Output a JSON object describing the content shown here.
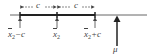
{
  "diagram": {
    "type": "confidence-interval-number-line",
    "dimension_labels": [
      "c",
      "c"
    ],
    "points": [
      {
        "var": "x",
        "sub": "2",
        "suffix": "−c"
      },
      {
        "var": "x",
        "sub": "2",
        "suffix": ""
      },
      {
        "var": "x",
        "sub": "2",
        "suffix": "+c"
      }
    ],
    "mu_label": "μ",
    "colors": {
      "line": "#555555",
      "interval": "#222222",
      "text": "#444444"
    }
  }
}
